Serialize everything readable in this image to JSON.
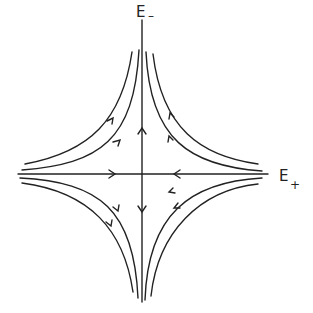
{
  "diagram": {
    "type": "saddle-point phase portrait",
    "axes": {
      "horizontal": {
        "label": "E",
        "subscript": "+"
      },
      "vertical": {
        "label": "E",
        "subscript": "–"
      }
    },
    "flow": {
      "horizontal_axis_direction": "inward (toward origin)",
      "vertical_axis_direction": "outward (away from origin)"
    },
    "curves_per_quadrant": 2,
    "colors": {
      "stroke": "#222222",
      "background": "#ffffff"
    }
  }
}
